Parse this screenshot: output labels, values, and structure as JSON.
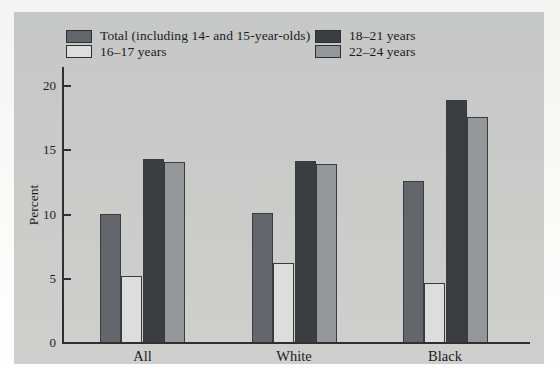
{
  "chart_data": {
    "type": "bar",
    "title": "",
    "categories": [
      "All",
      "White",
      "Black"
    ],
    "series": [
      {
        "name": "Total (including 14- and 15-year-olds)",
        "color": "#63676b",
        "values": [
          10.0,
          10.1,
          12.6
        ]
      },
      {
        "name": "16–17 years",
        "color": "#dddddb",
        "values": [
          5.2,
          6.2,
          4.7
        ]
      },
      {
        "name": "18–21 years",
        "color": "#3a3e41",
        "values": [
          14.3,
          14.2,
          18.9
        ]
      },
      {
        "name": "22–24 years",
        "color": "#94979a",
        "values": [
          14.1,
          13.9,
          17.6
        ]
      }
    ],
    "xlabel": "",
    "ylabel": "Percent",
    "yticks": [
      0,
      5,
      10,
      15,
      20
    ],
    "ylim": [
      0,
      21.4
    ],
    "grid": false,
    "legend_position": "top"
  },
  "colors": {
    "panel_bg": "#c9c9c9",
    "axis": "#2f2f2f",
    "text": "#1b1b1b",
    "swatch_border": "#2f2f2f"
  }
}
